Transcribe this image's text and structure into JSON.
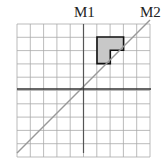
{
  "diagram": {
    "labels": {
      "m1": "M1",
      "m2": "M2"
    },
    "grid": {
      "cols": 10,
      "rows": 10,
      "left": 17,
      "top": 24,
      "cell": 13.3
    },
    "shape": {
      "fill": "#c8c8c8",
      "stroke": "#111111"
    },
    "colors": {
      "grid": "#aaaaaa",
      "axis": "#333333",
      "diagonal": "#999999"
    }
  }
}
